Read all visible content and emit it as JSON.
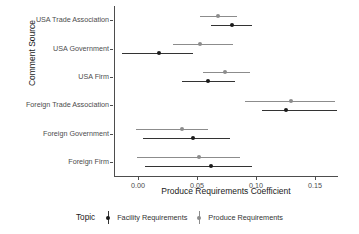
{
  "chart_data": {
    "type": "scatter",
    "title": "",
    "xlabel": "Produce Requirements Coefficient",
    "ylabel": "Comment Source",
    "xlim": [
      -0.0203,
      0.1695
    ],
    "xticks": [
      0.0,
      0.05,
      0.1,
      0.15
    ],
    "xticklabels": [
      "0.00",
      "0.05",
      "0.10",
      "0.15"
    ],
    "grid": false,
    "legend": {
      "title": "Topic",
      "position": "bottom",
      "entries": [
        {
          "name": "Facility Requirements",
          "color": "#1a1a1a"
        },
        {
          "name": "Produce Requirements",
          "color": "#8c8c8c"
        }
      ]
    },
    "categories": [
      "USA Trade Association",
      "USA Government",
      "USA Firm",
      "Foreign Trade Association",
      "Foreign Government",
      "Foreign Firm"
    ],
    "series": [
      {
        "name": "Produce Requirements",
        "color": "#8c8c8c",
        "points": [
          {
            "category": "USA Trade Association",
            "estimate": 0.0678,
            "low": 0.0525,
            "high": 0.0839
          },
          {
            "category": "USA Government",
            "estimate": 0.0525,
            "low": 0.0297,
            "high": 0.0805
          },
          {
            "category": "USA Firm",
            "estimate": 0.0737,
            "low": 0.0551,
            "high": 0.0949
          },
          {
            "category": "Foreign Trade Association",
            "estimate": 0.1297,
            "low": 0.0907,
            "high": 0.1669
          },
          {
            "category": "Foreign Government",
            "estimate": 0.0373,
            "low": -0.0017,
            "high": 0.0593
          },
          {
            "category": "Foreign Firm",
            "estimate": 0.0517,
            "low": -0.0008,
            "high": 0.0864
          }
        ]
      },
      {
        "name": "Facility Requirements",
        "color": "#1a1a1a",
        "points": [
          {
            "category": "USA Trade Association",
            "estimate": 0.0797,
            "low": 0.0619,
            "high": 0.0966
          },
          {
            "category": "USA Government",
            "estimate": 0.0178,
            "low": -0.0136,
            "high": 0.0466
          },
          {
            "category": "USA Firm",
            "estimate": 0.0593,
            "low": 0.0373,
            "high": 0.0822
          },
          {
            "category": "Foreign Trade Association",
            "estimate": 0.1254,
            "low": 0.1051,
            "high": 0.1686
          },
          {
            "category": "Foreign Government",
            "estimate": 0.0466,
            "low": 0.0042,
            "high": 0.078
          },
          {
            "category": "Foreign Firm",
            "estimate": 0.0619,
            "low": 0.0059,
            "high": 0.0966
          }
        ]
      }
    ]
  }
}
